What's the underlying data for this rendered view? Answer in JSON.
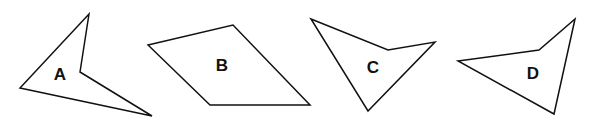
{
  "diagram": {
    "background": "#ffffff",
    "stroke_color": "#111111",
    "shapes": [
      {
        "label": "A",
        "points": "89,14 80,72 152,116 20,88",
        "label_pos": [
          60,
          76
        ]
      },
      {
        "label": "B",
        "points": "148,45 233,25 310,105 210,105",
        "label_pos": [
          222,
          67
        ]
      },
      {
        "label": "C",
        "points": "311,19 388,50 435,42 368,111",
        "label_pos": [
          373,
          69
        ]
      },
      {
        "label": "D",
        "points": "458,61 539,50 575,19 554,114",
        "label_pos": [
          533,
          75
        ]
      }
    ]
  }
}
